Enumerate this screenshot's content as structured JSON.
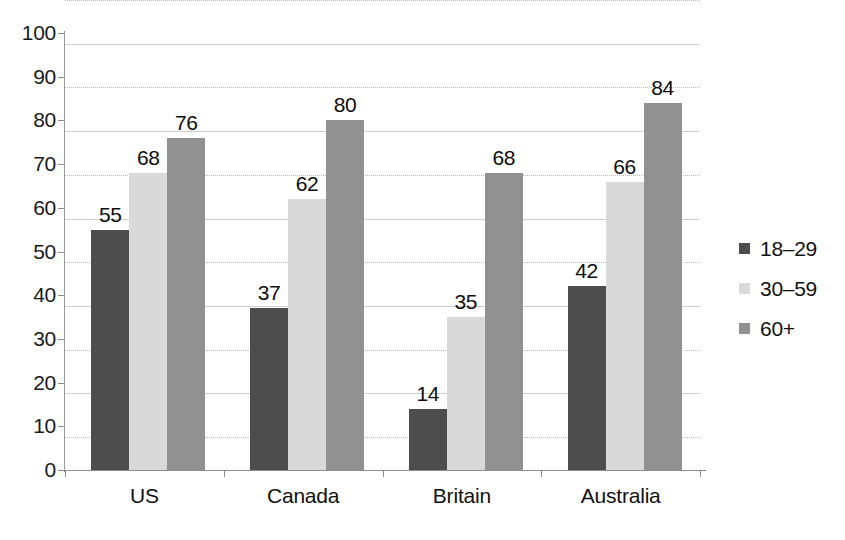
{
  "chart_data": {
    "type": "bar",
    "title": "",
    "subtitle": "",
    "xlabel": "",
    "ylabel": "",
    "categories": [
      "US",
      "Canada",
      "Britain",
      "Australia"
    ],
    "series": [
      {
        "name": "18–29",
        "color": "#4d4d4d",
        "values": [
          55,
          37,
          14,
          42
        ]
      },
      {
        "name": "30–59",
        "color": "#d9d9d9",
        "values": [
          68,
          62,
          35,
          66
        ]
      },
      {
        "name": "60+",
        "color": "#919191",
        "values": [
          76,
          80,
          68,
          84
        ]
      }
    ],
    "ylim": [
      0,
      100
    ],
    "y_ticks": [
      0,
      10,
      20,
      30,
      40,
      50,
      60,
      70,
      80,
      90,
      100
    ],
    "y_tick_labels": [
      "0",
      "10",
      "20",
      "30",
      "40",
      "50",
      "60",
      "70",
      "80",
      "90",
      "100"
    ],
    "grid": true,
    "grid_axis": "y",
    "legend_position": "right",
    "data_labels": true,
    "bar_labels": {
      "US": [
        "55",
        "68",
        "76"
      ],
      "Canada": [
        "37",
        "62",
        "80"
      ],
      "Britain": [
        "14",
        "35",
        "68"
      ],
      "Australia": [
        "42",
        "66",
        "84"
      ]
    }
  },
  "legend": {
    "items": [
      {
        "label": "18–29",
        "color": "#4d4d4d"
      },
      {
        "label": "30–59",
        "color": "#d9d9d9"
      },
      {
        "label": "60+",
        "color": "#919191"
      }
    ]
  },
  "axis": {
    "y_labels": [
      "100",
      "90",
      "80",
      "70",
      "60",
      "50",
      "40",
      "30",
      "20",
      "10",
      "0"
    ],
    "x_labels": [
      "US",
      "Canada",
      "Britain",
      "Australia"
    ]
  },
  "colors": {
    "background": "#ffffff",
    "gridline": "#b9b9b9",
    "axis": "#8d8d8d",
    "text": "#111111"
  }
}
